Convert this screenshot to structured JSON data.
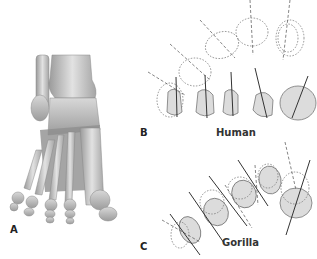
{
  "figure": {
    "panels": [
      {
        "id": "A",
        "label": "A",
        "description": "Dorsal view of human foot skeleton"
      },
      {
        "id": "B",
        "label": "B",
        "caption": "Human",
        "description": "Metatarsal head cross-sections with torsion axes"
      },
      {
        "id": "C",
        "label": "C",
        "caption": "Gorilla",
        "description": "Metatarsal head cross-sections with torsion axes"
      }
    ]
  }
}
